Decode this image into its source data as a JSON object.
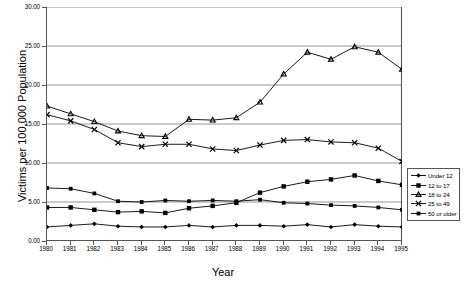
{
  "chart_data": {
    "type": "line",
    "title": "",
    "xlabel": "Year",
    "ylabel": "Victims per 100,000 Population",
    "x": [
      1980,
      1981,
      1982,
      1983,
      1984,
      1985,
      1986,
      1987,
      1988,
      1989,
      1990,
      1991,
      1992,
      1993,
      1994,
      1995
    ],
    "categories": [
      "1980",
      "1981",
      "1982",
      "1983",
      "1984",
      "1985",
      "1986",
      "1987",
      "1988",
      "1989",
      "1990",
      "1991",
      "1992",
      "1993",
      "1994",
      "1995"
    ],
    "xlim": [
      1980,
      1995
    ],
    "ylim": [
      0,
      30
    ],
    "yticks": [
      "0.00",
      "5.00",
      "10.00",
      "15.00",
      "20.00",
      "25.00",
      "30.00"
    ],
    "ytick_values": [
      0,
      5,
      10,
      15,
      20,
      25,
      30
    ],
    "grid": "horizontal",
    "legend_position": "right",
    "series": [
      {
        "name": "Under 12",
        "marker": "diamond",
        "values": [
          1.8,
          2.0,
          2.2,
          1.9,
          1.8,
          1.8,
          2.0,
          1.8,
          2.0,
          2.0,
          1.9,
          2.1,
          1.8,
          2.1,
          1.9,
          1.8
        ]
      },
      {
        "name": "12 to 17",
        "marker": "square",
        "values": [
          4.3,
          4.3,
          4.0,
          3.7,
          3.8,
          3.6,
          4.2,
          4.5,
          4.9,
          6.2,
          7.0,
          7.6,
          7.9,
          8.4,
          7.7,
          7.2
        ]
      },
      {
        "name": "18 to 24",
        "marker": "triangle",
        "values": [
          17.3,
          16.3,
          15.3,
          14.1,
          13.5,
          13.4,
          15.6,
          15.5,
          15.8,
          17.8,
          21.4,
          24.2,
          23.3,
          24.9,
          24.2,
          22.0
        ]
      },
      {
        "name": "25 to 49",
        "marker": "cross",
        "values": [
          16.2,
          15.4,
          14.3,
          12.6,
          12.1,
          12.4,
          12.4,
          11.8,
          11.6,
          12.3,
          12.9,
          13.0,
          12.7,
          12.6,
          11.9,
          10.2
        ]
      },
      {
        "name": "50 or older",
        "marker": "square-small",
        "values": [
          6.8,
          6.7,
          6.1,
          5.1,
          5.0,
          5.2,
          5.1,
          5.2,
          5.1,
          5.3,
          4.9,
          4.8,
          4.6,
          4.5,
          4.3,
          4.0
        ]
      }
    ]
  },
  "axes": {
    "y_title": "Victims per 100,000 Population",
    "x_title": "Year"
  },
  "legend": {
    "items": [
      {
        "label": "Under 12"
      },
      {
        "label": "12 to 17"
      },
      {
        "label": "18 to 24"
      },
      {
        "label": "25 to 49"
      },
      {
        "label": "50 or older"
      }
    ]
  }
}
